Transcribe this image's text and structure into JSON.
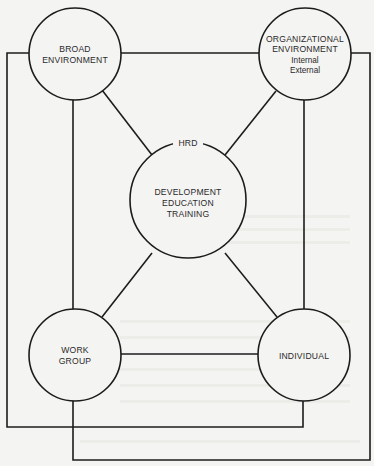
{
  "diagram": {
    "colors": {
      "background": "#f4f4f2",
      "line": "#1c1c1c",
      "text": "#2a2a2a"
    },
    "nodes": {
      "broad": {
        "lines": [
          "BROAD",
          "ENVIRONMENT"
        ]
      },
      "org": {
        "lines": [
          "ORGANIZATIONAL",
          "ENVIRONMENT"
        ],
        "sublines": [
          "Internal",
          "External"
        ]
      },
      "hrd": {
        "label": "HRD",
        "lines": [
          "DEVELOPMENT",
          "EDUCATION",
          "TRAINING"
        ]
      },
      "workgroup": {
        "lines": [
          "WORK",
          "GROUP"
        ]
      },
      "individual": {
        "lines": [
          "INDIVIDUAL"
        ]
      }
    },
    "edges": [
      {
        "from": "broad",
        "to": "org",
        "kind": "direct"
      },
      {
        "from": "broad",
        "to": "hrd",
        "kind": "direct"
      },
      {
        "from": "org",
        "to": "hrd",
        "kind": "direct"
      },
      {
        "from": "hrd",
        "to": "workgroup",
        "kind": "direct"
      },
      {
        "from": "hrd",
        "to": "individual",
        "kind": "direct"
      },
      {
        "from": "broad",
        "to": "workgroup",
        "kind": "direct"
      },
      {
        "from": "org",
        "to": "individual",
        "kind": "direct"
      },
      {
        "from": "workgroup",
        "to": "individual",
        "kind": "direct"
      },
      {
        "from": "broad",
        "to": "individual",
        "kind": "routed-outer"
      },
      {
        "from": "org",
        "to": "workgroup",
        "kind": "routed-outer"
      }
    ]
  }
}
